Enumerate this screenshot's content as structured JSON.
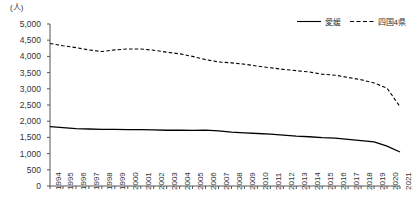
{
  "axis": {
    "unit_label": "(人)",
    "y_ticks": [
      "0",
      "500",
      "1,000",
      "1,500",
      "2,000",
      "2,500",
      "3,000",
      "3,500",
      "4,000",
      "4,500",
      "5,000"
    ]
  },
  "legend": {
    "items": [
      {
        "label": "愛媛",
        "style": "solid",
        "color": "#000000"
      },
      {
        "label": "四国4県",
        "style": "dashed",
        "color": "#000000"
      }
    ]
  },
  "chart_data": {
    "type": "line",
    "title": "",
    "xlabel": "",
    "ylabel": "(人)",
    "ylim": [
      0,
      5000
    ],
    "ytick_step": 500,
    "grid": false,
    "legend_position": "top-right",
    "categories": [
      "1994",
      "1995",
      "1996",
      "1997",
      "1998",
      "1999",
      "2000",
      "2001",
      "2002",
      "2003",
      "2004",
      "2005",
      "2006",
      "2007",
      "2008",
      "2009",
      "2010",
      "2011",
      "2012",
      "2013",
      "2014",
      "2015",
      "2016",
      "2017",
      "2018",
      "2019",
      "2020",
      "2021"
    ],
    "series": [
      {
        "name": "愛媛",
        "style": "solid",
        "color": "#000000",
        "values": [
          1830,
          1800,
          1770,
          1760,
          1745,
          1745,
          1740,
          1740,
          1730,
          1720,
          1720,
          1715,
          1725,
          1700,
          1660,
          1640,
          1620,
          1600,
          1570,
          1540,
          1520,
          1490,
          1480,
          1440,
          1400,
          1360,
          1230,
          1050
        ]
      },
      {
        "name": "四国4県",
        "style": "dashed",
        "color": "#000000",
        "values": [
          4400,
          4330,
          4270,
          4200,
          4150,
          4200,
          4230,
          4230,
          4190,
          4130,
          4080,
          4000,
          3900,
          3830,
          3800,
          3760,
          3700,
          3650,
          3600,
          3560,
          3520,
          3450,
          3420,
          3350,
          3280,
          3180,
          3020,
          2450
        ]
      }
    ]
  }
}
